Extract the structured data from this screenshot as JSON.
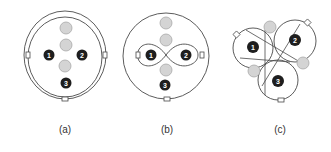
{
  "colors": {
    "line": "#4a4a4a",
    "dark_node": "#1e1e1e",
    "gray_node_fill": "#d4d4d4",
    "gray_node_stroke": "#a8a8a8",
    "connector_fill": "#ffffff"
  },
  "panels": [
    {
      "id": "a",
      "caption": "(a)",
      "nodes": [
        {
          "label": "1",
          "type": "dark"
        },
        {
          "label": "2",
          "type": "dark"
        },
        {
          "label": "3",
          "type": "dark"
        }
      ],
      "gray_nodes": 3,
      "connectors": 3,
      "loop": "double concentric ring"
    },
    {
      "id": "b",
      "caption": "(b)",
      "nodes": [
        {
          "label": "1",
          "type": "dark"
        },
        {
          "label": "2",
          "type": "dark"
        },
        {
          "label": "3",
          "type": "dark"
        }
      ],
      "gray_nodes": 3,
      "connectors": 3,
      "loop": "outer ring with figure-eight"
    },
    {
      "id": "c",
      "caption": "(c)",
      "nodes": [
        {
          "label": "1",
          "type": "dark"
        },
        {
          "label": "2",
          "type": "dark"
        },
        {
          "label": "3",
          "type": "dark"
        }
      ],
      "gray_nodes": 3,
      "connectors": 3,
      "loop": "three interlaced loops"
    }
  ]
}
